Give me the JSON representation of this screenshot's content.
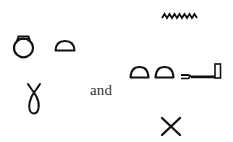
{
  "figure": {
    "left_group": {
      "row1": [
        {
          "name": "shen-ring",
          "description": "ring-shaped hieroglyph"
        },
        {
          "name": "bread-loaf",
          "description": "half-round loaf hieroglyph (t)"
        }
      ],
      "row2": [
        {
          "name": "wick-lasso",
          "description": "looped wick/lasso hieroglyph"
        }
      ]
    },
    "conjunction": "and",
    "right_group": {
      "row1": [
        {
          "name": "water-ripple",
          "description": "zigzag water hieroglyph (n)"
        }
      ],
      "row2": [
        {
          "name": "bread-loaf",
          "description": "half-round loaf hieroglyph (t)"
        },
        {
          "name": "bread-loaf",
          "description": "half-round loaf hieroglyph (t)"
        },
        {
          "name": "door-bolt",
          "description": "bolt hieroglyph (s)"
        }
      ],
      "row3": [
        {
          "name": "crossed-sticks",
          "description": "X-shaped hieroglyph"
        }
      ]
    },
    "colors": {
      "ink": "#111111",
      "background": "#ffffff",
      "text": "#333333"
    }
  }
}
